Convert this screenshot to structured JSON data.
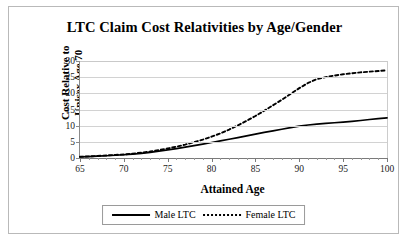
{
  "chart_data": {
    "type": "line",
    "title": "LTC Claim Cost Relativities by Age/Gender",
    "xlabel": "Attained Age",
    "ylabel": "Cost Relative to Unisex Age 70",
    "ylabel_line1": "Cost Relative to",
    "ylabel_line2": "Unisex Age 70",
    "xlim": [
      65,
      100
    ],
    "ylim": [
      0,
      30
    ],
    "xticks": [
      65,
      70,
      75,
      80,
      85,
      90,
      95,
      100
    ],
    "yticks": [
      0,
      5,
      10,
      15,
      20,
      25,
      30
    ],
    "xtick_minor_step": 1,
    "grid": "horizontal",
    "legend_position": "bottom",
    "x": [
      65,
      66,
      67,
      68,
      69,
      70,
      71,
      72,
      73,
      74,
      75,
      76,
      77,
      78,
      79,
      80,
      81,
      82,
      83,
      84,
      85,
      86,
      87,
      88,
      89,
      90,
      91,
      92,
      93,
      94,
      95,
      96,
      97,
      98,
      99,
      100
    ],
    "series": [
      {
        "name": "Male LTC",
        "style": "solid",
        "color": "#000000",
        "values": [
          0.35,
          0.45,
          0.55,
          0.7,
          0.85,
          1.0,
          1.2,
          1.45,
          1.75,
          2.1,
          2.5,
          2.9,
          3.35,
          3.85,
          4.3,
          4.8,
          5.3,
          5.8,
          6.3,
          6.85,
          7.4,
          7.9,
          8.4,
          8.9,
          9.4,
          9.85,
          10.2,
          10.5,
          10.7,
          10.9,
          11.1,
          11.35,
          11.6,
          11.9,
          12.2,
          12.4
        ]
      },
      {
        "name": "Female LTC",
        "style": "dotted",
        "color": "#000000",
        "values": [
          0.4,
          0.5,
          0.62,
          0.78,
          0.95,
          1.1,
          1.35,
          1.65,
          2.0,
          2.45,
          2.95,
          3.5,
          4.15,
          4.9,
          5.7,
          6.6,
          7.6,
          8.8,
          10.1,
          11.5,
          13.0,
          14.6,
          16.3,
          18.0,
          19.8,
          21.6,
          23.2,
          24.4,
          25.0,
          25.5,
          25.9,
          26.2,
          26.5,
          26.7,
          26.9,
          27.1
        ]
      }
    ],
    "legend": [
      {
        "label": "Male LTC",
        "style": "solid"
      },
      {
        "label": "Female LTC",
        "style": "dotted"
      }
    ]
  }
}
